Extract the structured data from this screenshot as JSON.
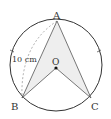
{
  "diagram": {
    "type": "geometry-circle-inscribed",
    "points": {
      "A": {
        "label": "A",
        "x": 57,
        "y": 21
      },
      "B": {
        "label": "B",
        "x": 22,
        "y": 98
      },
      "C": {
        "label": "C",
        "x": 91,
        "y": 98
      },
      "O": {
        "label": "O",
        "x": 56,
        "y": 68
      }
    },
    "circle": {
      "cx": 56,
      "cy": 65,
      "r": 46
    },
    "measure_label": "10 cm",
    "shaded_region": "A-B-O-C",
    "colors": {
      "stroke": "#333333",
      "shade": "#eeeeee",
      "dashed": "#999999"
    }
  }
}
